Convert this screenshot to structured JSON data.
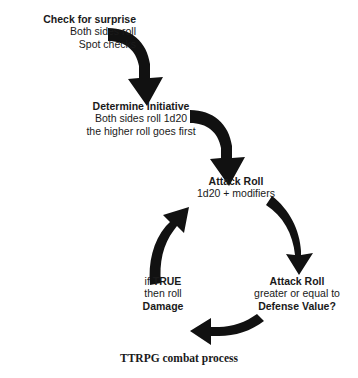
{
  "diagram": {
    "title": "TTRPG combat process",
    "background_color": "#ffffff",
    "arrow_color": "#111111",
    "text_color": "#1a1a1a",
    "nodes": [
      {
        "id": "check-for-surprise",
        "heading": "Check for surprise",
        "line2": "Both sides roll",
        "line3": "Spot checks"
      },
      {
        "id": "determine-initiative",
        "heading": "Determine Initiative",
        "line2": "Both sides roll 1d20",
        "line3": "the higher roll goes first"
      },
      {
        "id": "attack-roll",
        "heading": "Attack Roll",
        "line2": "1d20 + modifiers"
      },
      {
        "id": "attack-roll-check",
        "heading": "Attack Roll",
        "line2": "greater or equal to",
        "line3": "Defense Value?"
      },
      {
        "id": "if-true-damage",
        "line1_prefix": "if ",
        "line1_bold": "TRUE",
        "line2": "then roll",
        "line3": "Damage"
      }
    ],
    "arrows": [
      {
        "id": "arrow-surprise-to-initiative",
        "from": "check-for-surprise",
        "to": "determine-initiative"
      },
      {
        "id": "arrow-initiative-to-attack",
        "from": "determine-initiative",
        "to": "attack-roll"
      },
      {
        "id": "arrow-attack-to-check",
        "from": "attack-roll",
        "to": "attack-roll-check"
      },
      {
        "id": "arrow-check-to-true",
        "from": "attack-roll-check",
        "to": "if-true-damage"
      },
      {
        "id": "arrow-true-to-attack",
        "from": "if-true-damage",
        "to": "attack-roll"
      }
    ]
  }
}
